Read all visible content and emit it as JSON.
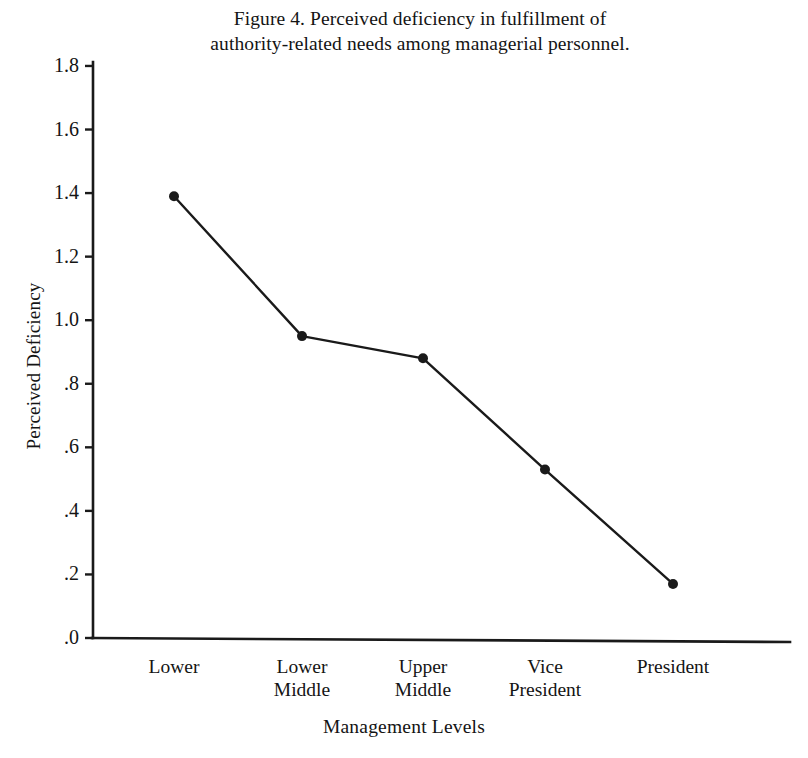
{
  "figure": {
    "title_line_1": "Figure 4. Perceived deficiency in fulfillment of",
    "title_line_2": "authority-related needs among managerial personnel."
  },
  "chart_data": {
    "type": "line",
    "title": "Figure 4. Perceived deficiency in fulfillment of authority-related needs among managerial personnel.",
    "xlabel": "Management Levels",
    "ylabel": "Perceived Deficiency",
    "categories": [
      "Lower",
      "Lower Middle",
      "Upper Middle",
      "Vice President",
      "President"
    ],
    "category_lines": [
      [
        "Lower",
        ""
      ],
      [
        "Lower",
        "Middle"
      ],
      [
        "Upper",
        "Middle"
      ],
      [
        "Vice",
        "President"
      ],
      [
        "President",
        ""
      ]
    ],
    "values": [
      1.39,
      0.95,
      0.88,
      0.53,
      0.17
    ],
    "ylim": [
      0.0,
      1.9
    ],
    "yticks": [
      0.0,
      0.2,
      0.4,
      0.6,
      0.8,
      1.0,
      1.2,
      1.4,
      1.6,
      1.8
    ],
    "ytick_labels": [
      ".0",
      ".2",
      ".4",
      ".6",
      ".8",
      "1.0",
      "1.2",
      "1.4",
      "1.6",
      "1.8"
    ],
    "grid": false,
    "legend": "none",
    "marker": "filled-circle",
    "line_color": "#1a1a1a",
    "marker_color": "#1a1a1a"
  }
}
